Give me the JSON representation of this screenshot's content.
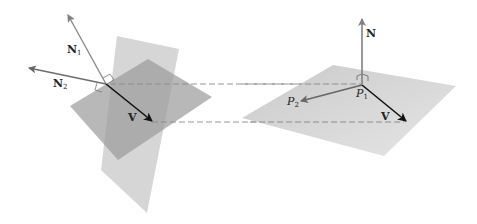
{
  "diagram": {
    "left_figure": {
      "labels": {
        "n1": "N",
        "n1_sub": "1",
        "n2": "N",
        "n2_sub": "2",
        "v": "V"
      },
      "planes": [
        {
          "name": "plane-1",
          "color": "#c8c8c8"
        },
        {
          "name": "plane-2",
          "color": "#a0a0a0"
        }
      ]
    },
    "right_figure": {
      "labels": {
        "n": "N",
        "p1": "P",
        "p1_sub": "1",
        "p2": "P",
        "p2_sub": "2",
        "v": "V"
      },
      "plane_color": "#d2d2d2"
    },
    "connectors": {
      "style": "dashed",
      "color": "#888888",
      "count": 2
    },
    "colors": {
      "normal_vector": "#808080",
      "direction_vector": "#111111",
      "p2_vector": "#666666"
    }
  }
}
